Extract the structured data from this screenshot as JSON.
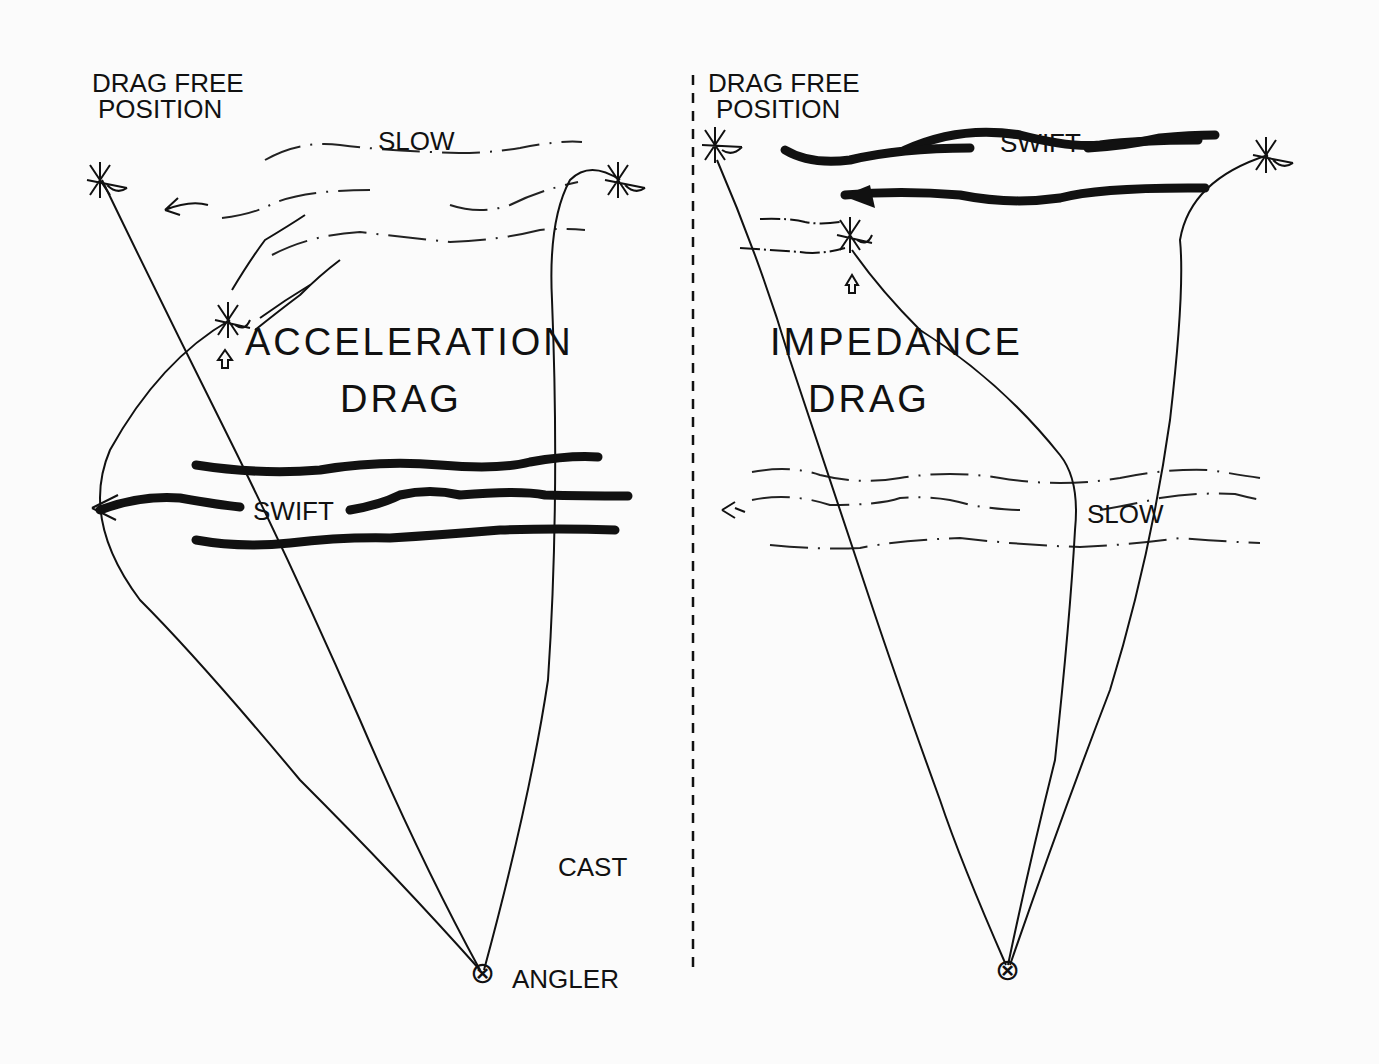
{
  "left_panel": {
    "drag_free_line1": "DRAG FREE",
    "drag_free_line2": "POSITION",
    "slow_label": "SLOW",
    "swift_label": "SWIFT",
    "title_line1": "ACCELERATION",
    "title_line2": "DRAG",
    "cast_label": "CAST",
    "angler_label": "ANGLER"
  },
  "right_panel": {
    "drag_free_line1": "DRAG FREE",
    "drag_free_line2": "POSITION",
    "swift_label": "SWIFT",
    "slow_label": "SLOW",
    "title_line1": "IMPEDANCE",
    "title_line2": "DRAG"
  },
  "symbols": {
    "angler_symbol": "⊗",
    "arrow_up": "⇧"
  },
  "colors": {
    "ink": "#111111",
    "paper": "#fbfbfb"
  }
}
